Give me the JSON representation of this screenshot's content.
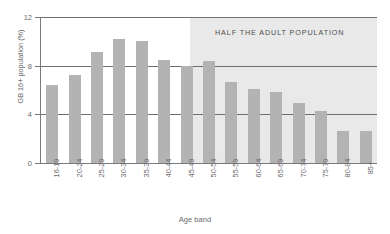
{
  "chart_data": {
    "type": "bar",
    "title": "",
    "xlabel": "Age band",
    "ylabel": "GB 16+ population (%)",
    "ylim": [
      0,
      12
    ],
    "yticks": [
      "0",
      "4",
      "8",
      "12"
    ],
    "grid": true,
    "legend": "none",
    "bar_color": "#b3b3b3",
    "annotation": "HALF THE ADULT POPULATION",
    "annotation_region": {
      "from_category": "45-49",
      "shaded": true,
      "shade_color": "#e9e9e9"
    },
    "categories": [
      "16-19",
      "20-24",
      "25-29",
      "30-34",
      "35-39",
      "40-44",
      "45-49",
      "50-54",
      "55-59",
      "60-64",
      "65-69",
      "70-74",
      "75-79",
      "80-84",
      "85+"
    ],
    "values": [
      6.4,
      7.2,
      9.1,
      10.2,
      10.0,
      8.5,
      8.0,
      8.4,
      6.7,
      6.1,
      5.8,
      4.9,
      4.3,
      2.6,
      2.6
    ]
  }
}
